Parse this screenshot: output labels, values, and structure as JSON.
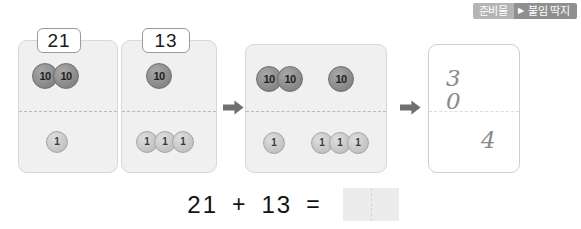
{
  "badge": {
    "left_label": "준비물",
    "arrow_glyph": "▶",
    "right_label": "붙임 딱지"
  },
  "cards": [
    {
      "name": "card-21",
      "label": "21",
      "tens_groups": [
        2
      ],
      "ones_groups": [
        1
      ],
      "ten_coin_text": "10",
      "one_coin_text": "1"
    },
    {
      "name": "card-13",
      "label": "13",
      "tens_groups": [
        1
      ],
      "ones_groups": [
        3
      ],
      "ten_coin_text": "10",
      "one_coin_text": "1"
    },
    {
      "name": "card-combined",
      "label": "",
      "tens_groups": [
        2,
        1
      ],
      "ones_groups": [
        1,
        3
      ],
      "ten_coin_text": "10",
      "one_coin_text": "1"
    }
  ],
  "result_card": {
    "name": "card-answer",
    "tens_digits": "3 0",
    "ones_digit": "4"
  },
  "arrows": {
    "glyph": "➡",
    "count": 2
  },
  "equation": {
    "left_operand": "21",
    "operator": "+",
    "right_operand": "13",
    "equals": "=",
    "answer": ""
  },
  "colors": {
    "card_fill": "#f0f0f0",
    "card_border": "#d8d8d8",
    "ten_coin": "#8e8e8e",
    "one_coin": "#c9c9c9",
    "badge_left": "#b4b4b4",
    "badge_right": "#8f8f8f",
    "answer_box": "#ececec",
    "handwriting": "#8a8a8a"
  }
}
